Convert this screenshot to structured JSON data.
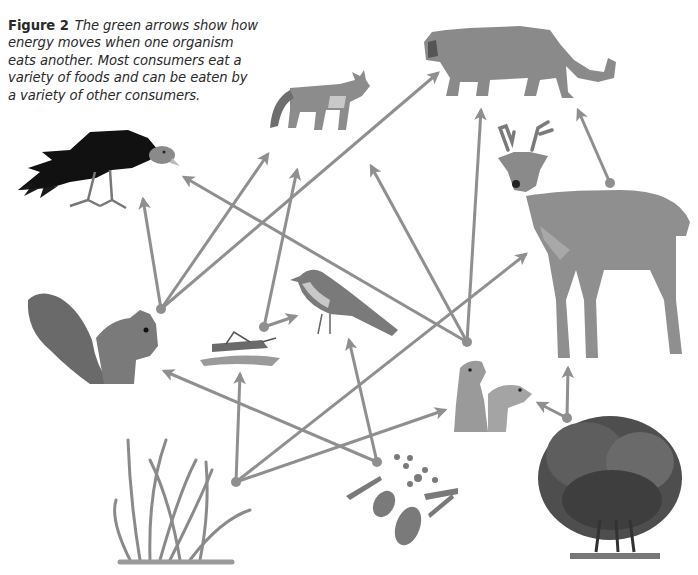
{
  "caption": {
    "figure_label": "Figure 2",
    "text": "The green arrows show how energy moves when one organism eats another. Most consumers eat a variety of foods and can be eaten by a variety of other consumers."
  },
  "colors": {
    "arrow": "#8f8f8f",
    "text": "#2a2a2a",
    "background": "#ffffff"
  },
  "organisms": [
    {
      "id": "vulture",
      "label": "vulture",
      "role": "consumer"
    },
    {
      "id": "fox",
      "label": "fox",
      "role": "consumer"
    },
    {
      "id": "cougar",
      "label": "cougar",
      "role": "consumer"
    },
    {
      "id": "deer",
      "label": "deer",
      "role": "consumer"
    },
    {
      "id": "squirrel",
      "label": "squirrel",
      "role": "consumer"
    },
    {
      "id": "grasshopper",
      "label": "grasshopper",
      "role": "consumer"
    },
    {
      "id": "bird",
      "label": "bird",
      "role": "consumer"
    },
    {
      "id": "prairie_dogs",
      "label": "prairie dogs",
      "role": "consumer"
    },
    {
      "id": "grass",
      "label": "grass",
      "role": "producer"
    },
    {
      "id": "seeds",
      "label": "seeds and nuts",
      "role": "producer"
    },
    {
      "id": "shrub",
      "label": "shrub",
      "role": "producer"
    }
  ],
  "arrows": [
    {
      "from": "squirrel",
      "to": "vulture"
    },
    {
      "from": "squirrel",
      "to": "fox"
    },
    {
      "from": "squirrel",
      "to": "cougar"
    },
    {
      "from": "grasshopper",
      "to": "fox"
    },
    {
      "from": "grasshopper",
      "to": "bird"
    },
    {
      "from": "prairie_dogs",
      "to": "vulture"
    },
    {
      "from": "prairie_dogs",
      "to": "fox"
    },
    {
      "from": "prairie_dogs",
      "to": "cougar"
    },
    {
      "from": "deer",
      "to": "cougar"
    },
    {
      "from": "grass",
      "to": "grasshopper"
    },
    {
      "from": "grass",
      "to": "deer"
    },
    {
      "from": "grass",
      "to": "prairie_dogs"
    },
    {
      "from": "seeds",
      "to": "squirrel"
    },
    {
      "from": "seeds",
      "to": "bird"
    },
    {
      "from": "shrub",
      "to": "deer"
    },
    {
      "from": "shrub",
      "to": "prairie_dogs"
    }
  ]
}
